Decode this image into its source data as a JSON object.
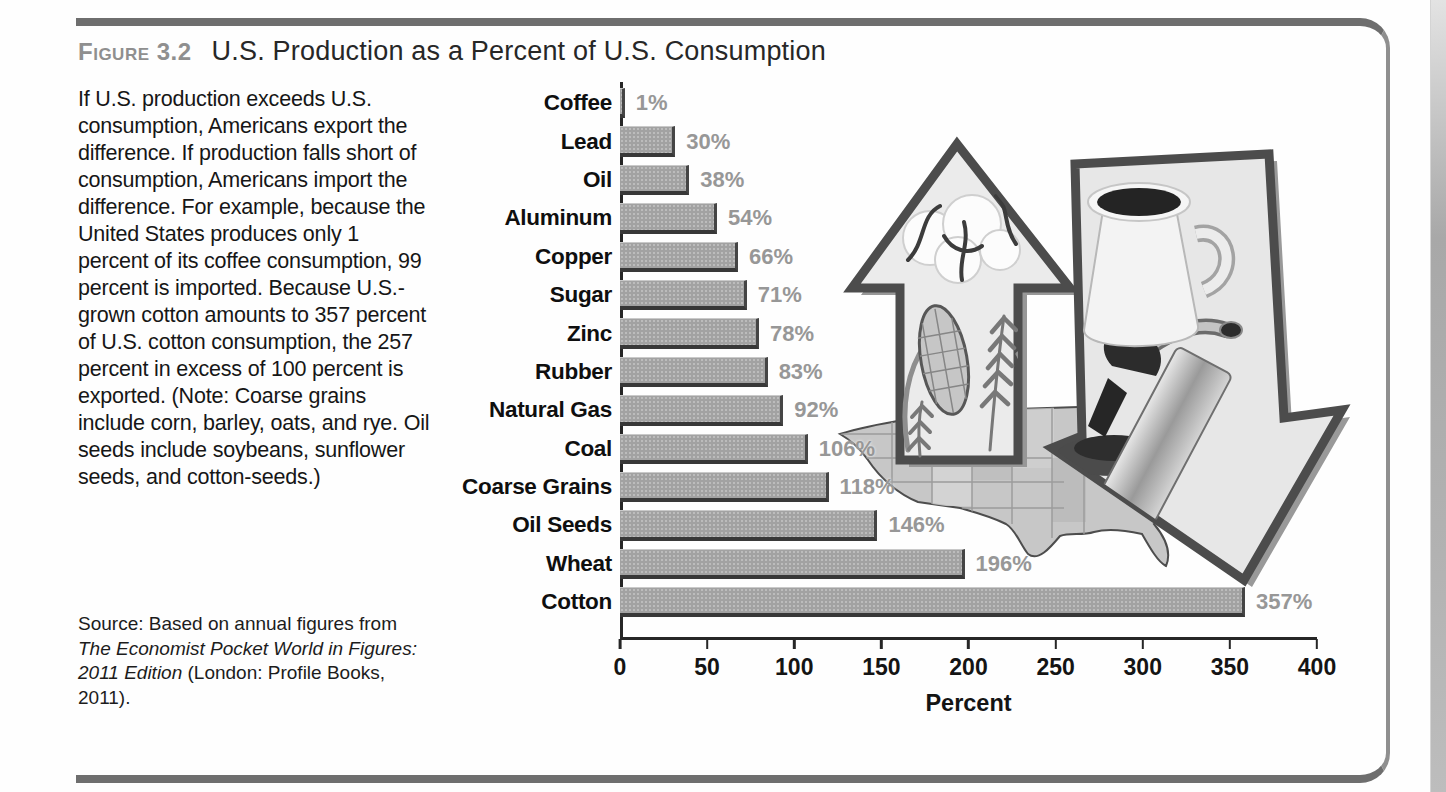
{
  "figure": {
    "label": "Figure 3.2",
    "title": "U.S. Production as a Percent of U.S. Consumption"
  },
  "caption": "If U.S. production exceeds U.S. consumption, Americans export the difference. If production falls short of consumption, Americans import the difference. For example, because the United States produces only 1 percent of its coffee consumption, 99 percent is imported. Because U.S.-grown cotton amounts to 357 percent of U.S. cotton consumption, the 257 percent in excess of 100 percent is exported. (Note: Coarse grains include corn, barley, oats, and rye. Oil seeds include soybeans, sunflower seeds, and cotton-seeds.)",
  "source": {
    "prefix": "Source: Based on annual figures from ",
    "italic": "The Economist Pocket World in Figures: 2011 Edition ",
    "suffix": "(London: Profile Books, 2011)."
  },
  "chart_data": {
    "type": "bar",
    "orientation": "horizontal",
    "title": "U.S. Production as a Percent of U.S. Consumption",
    "categories": [
      "Coffee",
      "Lead",
      "Oil",
      "Aluminum",
      "Copper",
      "Sugar",
      "Zinc",
      "Rubber",
      "Natural Gas",
      "Coal",
      "Coarse Grains",
      "Oil Seeds",
      "Wheat",
      "Cotton"
    ],
    "values": [
      1,
      30,
      38,
      54,
      66,
      71,
      78,
      83,
      92,
      106,
      118,
      146,
      196,
      357
    ],
    "value_labels": [
      "1%",
      "30%",
      "38%",
      "54%",
      "66%",
      "71%",
      "78%",
      "83%",
      "92%",
      "106%",
      "118%",
      "146%",
      "196%",
      "357%"
    ],
    "xlabel": "Percent",
    "x_ticks": [
      0,
      50,
      100,
      150,
      200,
      250,
      300,
      350,
      400
    ],
    "xlim": [
      0,
      400
    ],
    "grid": false,
    "legend": "none",
    "bar_color": "#a2a2a2",
    "bar_edge_color": "#3e3e3e",
    "value_label_color": "#979797",
    "category_label_color": "#0f0f0f"
  },
  "illustration": {
    "items": [
      "us-map-background",
      "up-arrow-with-cotton-corn-wheat",
      "down-arrow-with-coffee-cup-and-gas-nozzle"
    ]
  }
}
